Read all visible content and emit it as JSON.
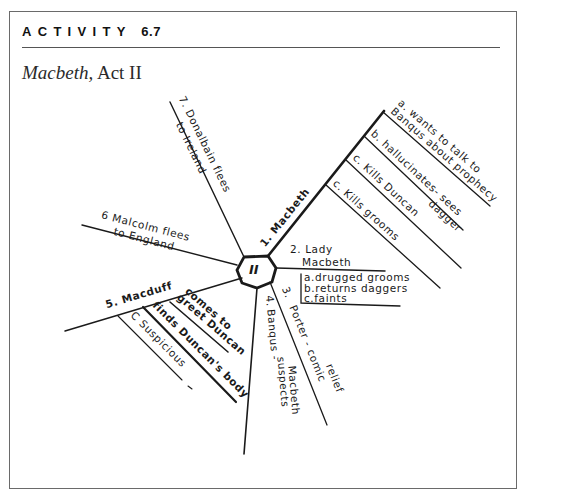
{
  "header": {
    "activity_label": "ACTIVITY",
    "activity_number": "6.7",
    "title_italic": "Macbeth,",
    "title_rest": " Act II"
  },
  "diagram": {
    "hub_label": "II",
    "branches": [
      {
        "id": "1",
        "label": "1. Macbeth",
        "sub_items": [
          {
            "letter": "a",
            "text": "a. wants to talk to",
            "text2": "Banqus about prophecy"
          },
          {
            "letter": "b",
            "text": "b. hallucinates- sees",
            "text2": "dagger"
          },
          {
            "letter": "c",
            "text": "c. Kills Duncan"
          },
          {
            "letter": "c2",
            "text": "c. Kills grooms"
          }
        ]
      },
      {
        "id": "2",
        "label": "2. Lady",
        "label2": "Macbeth",
        "sub_items": [
          {
            "letter": "a",
            "text": "a.drugged grooms"
          },
          {
            "letter": "b",
            "text": "b.returns daggers"
          },
          {
            "letter": "c",
            "text": "c.faints"
          }
        ]
      },
      {
        "id": "3",
        "label": "3.",
        "text": "Porter - comic",
        "text2": "relief"
      },
      {
        "id": "4",
        "label": "4.",
        "text": "Banqus -",
        "text2": "suspects",
        "text3": "Macbeth"
      },
      {
        "id": "5",
        "label": "5. Macduff",
        "sub_items": [
          {
            "letter": "a",
            "text": "comes to",
            "text2": "greet Duncan"
          },
          {
            "letter": "b",
            "text": "finds Duncan's body"
          },
          {
            "letter": "c",
            "text": "C Suspicious"
          }
        ]
      },
      {
        "id": "6",
        "label": "6 Malcolm flees",
        "text2": "to England"
      },
      {
        "id": "7",
        "label": "7. Donalbain flees",
        "text2": "to Ireland"
      }
    ]
  },
  "colors": {
    "ink": "#1a1a1a",
    "frame": "#6a6a6a",
    "background": "#ffffff"
  }
}
